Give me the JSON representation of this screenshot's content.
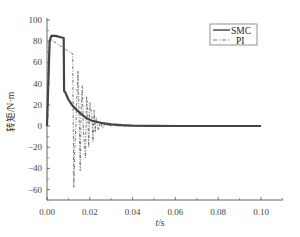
{
  "chart_data": {
    "type": "line",
    "title": "",
    "xlabel": "t/s",
    "ylabel": "转矩/N·m",
    "xlim": [
      0.0,
      0.1
    ],
    "ylim": [
      -70,
      100
    ],
    "x_ticks": [
      "0.00",
      "0.02",
      "0.04",
      "0.06",
      "0.08",
      "0.10"
    ],
    "y_ticks": [
      "100",
      "80",
      "60",
      "40",
      "20",
      "0",
      "-20",
      "-40",
      "-60"
    ],
    "grid": false,
    "legend_position": "upper right",
    "legend": [
      "SMC",
      "PI"
    ],
    "series": [
      {
        "name": "SMC",
        "style": "solid",
        "color": "#444444",
        "x": [
          0.0,
          0.0012,
          0.002,
          0.004,
          0.006,
          0.0078,
          0.008,
          0.0085,
          0.01,
          0.012,
          0.015,
          0.018,
          0.021,
          0.025,
          0.03,
          0.035,
          0.04,
          0.05,
          0.06,
          0.08,
          0.1
        ],
        "y": [
          0,
          80,
          85,
          85,
          84,
          83,
          33,
          32,
          25,
          19,
          13,
          8,
          5,
          3,
          1.5,
          0.8,
          0.4,
          0.1,
          0,
          0,
          0
        ]
      },
      {
        "name": "PI",
        "style": "dash-dot",
        "color": "#666666",
        "x": [
          0.0,
          0.0015,
          0.003,
          0.006,
          0.009,
          0.012,
          0.0125,
          0.013,
          0.0135,
          0.014,
          0.0145,
          0.015,
          0.0155,
          0.016,
          0.0165,
          0.017,
          0.018,
          0.0185,
          0.019,
          0.0195,
          0.02,
          0.021,
          0.0215,
          0.022,
          0.0225,
          0.023,
          0.024,
          0.025,
          0.026,
          0.027,
          0.028,
          0.03,
          0.035,
          0.04,
          0.06,
          0.1
        ],
        "y": [
          0,
          82,
          80,
          76,
          72,
          68,
          -58,
          -20,
          0,
          30,
          52,
          10,
          -42,
          20,
          38,
          -5,
          -30,
          28,
          14,
          -20,
          22,
          10,
          -15,
          15,
          -6,
          8,
          -4,
          4,
          -2,
          2,
          0.5,
          0.3,
          0,
          0,
          0,
          0
        ]
      }
    ]
  },
  "legend": {
    "items": [
      {
        "label": "SMC",
        "style": "solid"
      },
      {
        "label": "PI",
        "style": "dash-dot"
      }
    ]
  },
  "axes": {
    "xlabel_italic": "t",
    "xlabel_unit": "/s",
    "ylabel": "转矩/N·m"
  },
  "colors": {
    "axis": "#555555",
    "smc": "#444444",
    "pi": "#666666"
  }
}
